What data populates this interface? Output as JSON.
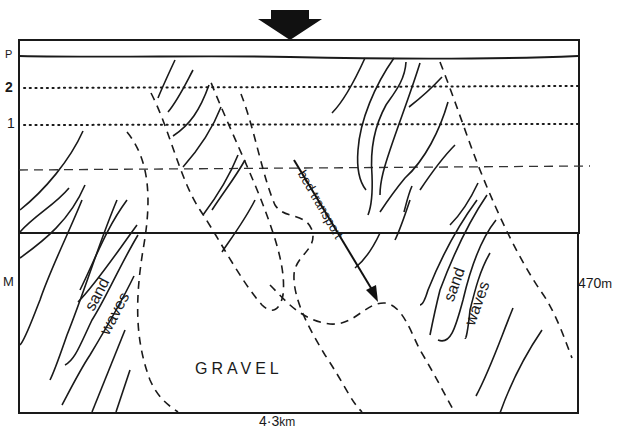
{
  "figure": {
    "colors": {
      "ink": "#1a1a1a",
      "background": "#ffffff"
    },
    "top_arrow": {
      "icon": "downward-arrow-icon"
    },
    "left_axis_labels": {
      "p": "P",
      "line_2": "2",
      "line_1": "1",
      "m": "M"
    },
    "dimensions": {
      "width_value": "4·3",
      "width_unit": "km",
      "height_value": "470",
      "height_unit": "m"
    },
    "regions": {
      "sand_waves_left_1": "sand",
      "sand_waves_left_2": "waves",
      "sand_waves_right_1": "sand",
      "sand_waves_right_2": "waves",
      "gravel": "GRAVEL"
    },
    "bed_transport": {
      "label": "bed transport",
      "icon": "transport-direction-arrow-icon"
    },
    "line_styles": {
      "P": "solid",
      "2": "dotted",
      "1": "dotted",
      "reference": "dashed",
      "gravel_boundary": "dashed",
      "sand_wave_crests": "solid"
    }
  }
}
